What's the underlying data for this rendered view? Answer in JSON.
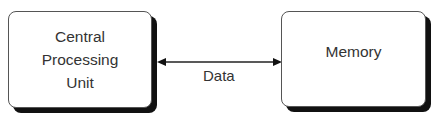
{
  "diagram": {
    "nodes": [
      {
        "id": "cpu",
        "label_lines": [
          "Central",
          "Processing",
          "Unit"
        ]
      },
      {
        "id": "memory",
        "label": "Memory"
      }
    ],
    "edges": [
      {
        "from": "cpu",
        "to": "memory",
        "label": "Data",
        "direction": "bidirectional"
      }
    ]
  }
}
